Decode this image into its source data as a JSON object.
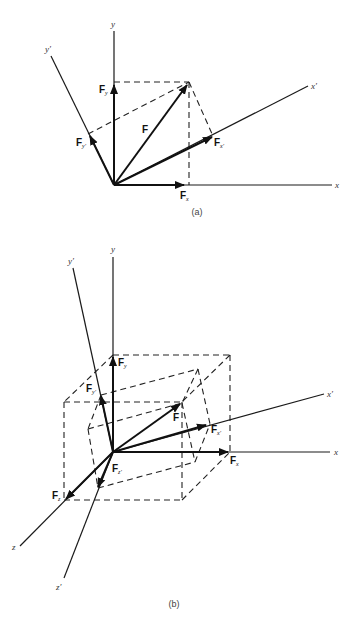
{
  "figure": {
    "panels": [
      {
        "id": "a",
        "caption": "(a)",
        "axes": {
          "x": "x",
          "y": "y",
          "x_prime": "x′",
          "y_prime": "y′"
        },
        "vectors": {
          "F": "F",
          "Fx": {
            "base": "F",
            "sub": "x"
          },
          "Fy": {
            "base": "F",
            "sub": "y"
          },
          "Fx_prime": {
            "base": "F",
            "sub": "x′"
          },
          "Fy_prime": {
            "base": "F",
            "sub": "y′"
          }
        }
      },
      {
        "id": "b",
        "caption": "(b)",
        "axes": {
          "x": "x",
          "y": "y",
          "z": "z",
          "x_prime": "x′",
          "y_prime": "y′",
          "z_prime": "z′"
        },
        "vectors": {
          "F": "F",
          "Fx": {
            "base": "F",
            "sub": "x"
          },
          "Fy": {
            "base": "F",
            "sub": "y"
          },
          "Fz": {
            "base": "F",
            "sub": "z"
          },
          "Fx_prime": {
            "base": "F",
            "sub": "x′"
          },
          "Fy_prime": {
            "base": "F",
            "sub": "y′"
          },
          "Fz_prime": {
            "base": "F",
            "sub": "z′"
          }
        }
      }
    ]
  }
}
